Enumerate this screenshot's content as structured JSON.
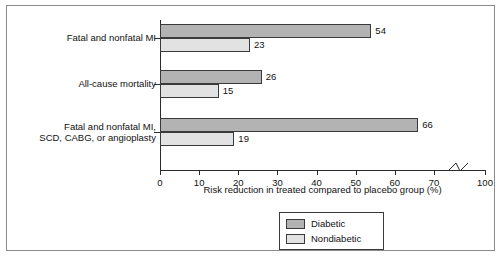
{
  "chart_data": {
    "type": "bar",
    "orientation": "horizontal",
    "title": "",
    "xlabel": "Risk reduction in treated compared to placebo group (%)",
    "ylabel": "",
    "xlim": [
      0,
      100
    ],
    "xticks": [
      0,
      10,
      20,
      30,
      40,
      50,
      60,
      70,
      100
    ],
    "xtick_labels": [
      "0",
      "10",
      "20",
      "30",
      "40",
      "50",
      "60",
      "70",
      "100"
    ],
    "axis_break": {
      "present": true,
      "between": [
        70,
        100
      ],
      "style": "zigzag"
    },
    "grid": false,
    "legend_position": "bottom-center",
    "categories": [
      "Fatal and nonfatal MI",
      "All-cause mortality",
      "Fatal and nonfatal MI, SCD, CABG, or angioplasty"
    ],
    "category_lines": [
      [
        "Fatal and nonfatal MI"
      ],
      [
        "All-cause mortality"
      ],
      [
        "Fatal and nonfatal MI,",
        "SCD, CABG, or angioplasty"
      ]
    ],
    "series": [
      {
        "name": "Diabetic",
        "color": "#b3b3b3",
        "values": [
          54,
          26,
          66
        ]
      },
      {
        "name": "Nondiabetic",
        "color": "#e2e2e2",
        "values": [
          23,
          15,
          19
        ]
      }
    ],
    "value_labels": [
      [
        "54",
        "23"
      ],
      [
        "26",
        "15"
      ],
      [
        "66",
        "19"
      ]
    ]
  },
  "legend": {
    "entries": [
      {
        "label": "Diabetic",
        "swatch": "diabetic"
      },
      {
        "label": "Nondiabetic",
        "swatch": "nondiabetic"
      }
    ]
  },
  "colors": {
    "diabetic": "#b3b3b3",
    "nondiabetic": "#e2e2e2",
    "axis": "#2b2b2b",
    "frame": "#8b8b8b",
    "text": "#111111",
    "background": "#ffffff"
  }
}
